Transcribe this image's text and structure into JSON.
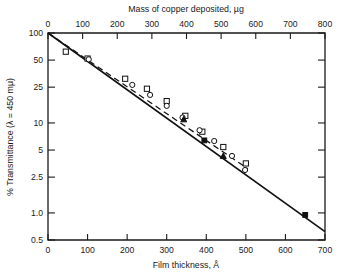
{
  "chart_data": {
    "type": "line",
    "title": "",
    "xlabel": "Film thickness, Å",
    "top_xlabel": "Mass of copper deposited, µg",
    "ylabel": "% Transmittance (λ = 450 mμ)",
    "yscale": "log",
    "xlim": [
      0,
      700
    ],
    "top_xlim": [
      0,
      800
    ],
    "ylim": [
      0.5,
      100
    ],
    "grid": false,
    "legend": "none",
    "x_ticks": [
      0,
      100,
      200,
      300,
      400,
      500,
      600,
      700
    ],
    "x_tick_labels": [
      "0",
      "100",
      "200",
      "300",
      "400",
      "500",
      "600",
      "700"
    ],
    "top_x_ticks": [
      0,
      100,
      200,
      300,
      400,
      500,
      600,
      700,
      800
    ],
    "top_x_tick_labels": [
      "0",
      "100",
      "200",
      "300",
      "400",
      "500",
      "600",
      "700",
      "800"
    ],
    "y_ticks": [
      100,
      50,
      25,
      10,
      5,
      2.5,
      1.0,
      0.5
    ],
    "y_tick_labels": [
      "100",
      "50",
      "25",
      "10",
      "5",
      "2.5",
      "1.0",
      "0.5"
    ],
    "series": [
      {
        "name": "solid-line-fit",
        "style": "solid",
        "marker": "none",
        "x": [
          0,
          700
        ],
        "values": [
          100,
          0.62
        ]
      },
      {
        "name": "dashed-line-fit",
        "style": "dashed",
        "marker": "none",
        "x": [
          0,
          505
        ],
        "values": [
          100,
          3.1
        ]
      },
      {
        "name": "open-squares",
        "style": "none",
        "marker": "open-square",
        "x": [
          45,
          100,
          195,
          250,
          300,
          347,
          390,
          443,
          500
        ],
        "values": [
          62,
          52,
          31,
          24,
          17.5,
          12.0,
          8.0,
          5.4,
          3.55
        ]
      },
      {
        "name": "open-circles",
        "style": "none",
        "marker": "open-circle",
        "x": [
          103,
          213,
          258,
          300,
          340,
          383,
          420,
          465,
          498
        ],
        "values": [
          51,
          26.5,
          20.5,
          15.5,
          11.5,
          8.3,
          6.3,
          4.3,
          3.0
        ]
      },
      {
        "name": "filled-markers",
        "style": "none",
        "marker": "filled",
        "x": [
          343,
          395,
          443,
          650
        ],
        "values": [
          11.0,
          6.4,
          4.3,
          0.95
        ]
      }
    ]
  }
}
